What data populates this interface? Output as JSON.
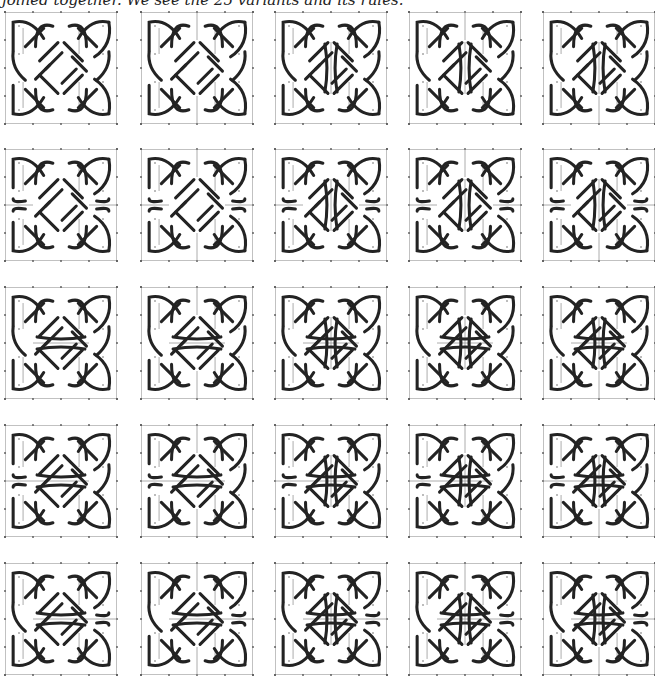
{
  "caption": "joined together. We see the 25 variants and its rules.",
  "colors": {
    "knot": "#232323",
    "frame": "#b4b4b4",
    "tick": "#555555",
    "dot": "#666666",
    "wall": "#9a9a9a"
  },
  "grid": {
    "columns_x": [
      5,
      141,
      275,
      409,
      543
    ],
    "rows_y": [
      12,
      149,
      287,
      425,
      563
    ],
    "tile_size": 110
  },
  "column_walls": [
    {
      "name": "none",
      "vt": false,
      "vc": false,
      "vb": false
    },
    {
      "name": "top-and-bottom",
      "vt": true,
      "vc": false,
      "vb": true
    },
    {
      "name": "center",
      "vt": false,
      "vc": true,
      "vb": false
    },
    {
      "name": "top-and-center",
      "vt": true,
      "vc": true,
      "vb": false
    },
    {
      "name": "center-and-bottom",
      "vt": false,
      "vc": true,
      "vb": true
    }
  ],
  "row_walls": [
    {
      "name": "none",
      "hl": false,
      "hc": false,
      "hr": false
    },
    {
      "name": "left-and-right",
      "hl": true,
      "hc": false,
      "hr": true
    },
    {
      "name": "center",
      "hl": false,
      "hc": true,
      "hr": false
    },
    {
      "name": "left-and-center",
      "hl": true,
      "hc": true,
      "hr": false
    },
    {
      "name": "center-and-right",
      "hl": false,
      "hc": true,
      "hr": true
    }
  ],
  "tiles": [
    {
      "row": 0,
      "col": 0
    },
    {
      "row": 0,
      "col": 1
    },
    {
      "row": 0,
      "col": 2
    },
    {
      "row": 0,
      "col": 3
    },
    {
      "row": 0,
      "col": 4
    },
    {
      "row": 1,
      "col": 0
    },
    {
      "row": 1,
      "col": 1
    },
    {
      "row": 1,
      "col": 2
    },
    {
      "row": 1,
      "col": 3
    },
    {
      "row": 1,
      "col": 4
    },
    {
      "row": 2,
      "col": 0
    },
    {
      "row": 2,
      "col": 1
    },
    {
      "row": 2,
      "col": 2
    },
    {
      "row": 2,
      "col": 3
    },
    {
      "row": 2,
      "col": 4
    },
    {
      "row": 3,
      "col": 0
    },
    {
      "row": 3,
      "col": 1
    },
    {
      "row": 3,
      "col": 2
    },
    {
      "row": 3,
      "col": 3
    },
    {
      "row": 3,
      "col": 4
    },
    {
      "row": 4,
      "col": 0
    },
    {
      "row": 4,
      "col": 1
    },
    {
      "row": 4,
      "col": 2
    },
    {
      "row": 4,
      "col": 3
    },
    {
      "row": 4,
      "col": 4
    }
  ]
}
